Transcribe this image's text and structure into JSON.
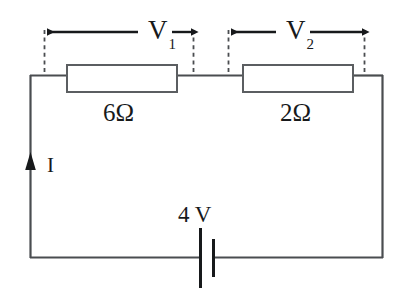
{
  "figure": {
    "name": "series-resistor-circuit-diagram",
    "background_color": "#ffffff",
    "wire_color": "#4a4d50",
    "ink_color": "#17191b"
  },
  "labels": {
    "v1": "V",
    "v1_subscript": "1",
    "v2": "V",
    "v2_subscript": "2",
    "resistor_1": "6Ω",
    "resistor_2": "2Ω",
    "current": "I",
    "battery": "4 V"
  },
  "circuit": {
    "loop": {
      "left_x": 30,
      "right_x": 383,
      "top_y": 75,
      "bottom_y": 258
    },
    "resistors": [
      {
        "name": "resistor-6-ohm",
        "label": "6Ω",
        "value": 6,
        "unit": "Ω",
        "x": 67,
        "y": 65,
        "width": 110,
        "height": 27
      },
      {
        "name": "resistor-2-ohm",
        "label": "2Ω",
        "value": 2,
        "unit": "Ω",
        "x": 243,
        "y": 65,
        "width": 110,
        "height": 27
      }
    ],
    "battery": {
      "name": "battery-4v",
      "label": "4 V",
      "value": 4,
      "unit": "V",
      "center_x": 205,
      "long_plate_x": 200,
      "short_plate_x": 213,
      "long_plate_half_height": 30,
      "short_plate_half_height": 19
    },
    "current_arrow": {
      "name": "current-arrow",
      "label": "I",
      "x": 30,
      "y": 163,
      "direction": "up"
    },
    "voltage_spans": [
      {
        "name": "voltage-span-v1",
        "label": "V",
        "subscript": "1",
        "left_x": 44,
        "right_x": 193,
        "arrow_y": 32,
        "dash_top_y": 30,
        "dash_bottom_y": 75
      },
      {
        "name": "voltage-span-v2",
        "label": "V",
        "subscript": "2",
        "left_x": 228,
        "right_x": 364,
        "arrow_y": 32,
        "dash_top_y": 30,
        "dash_bottom_y": 75
      }
    ]
  }
}
